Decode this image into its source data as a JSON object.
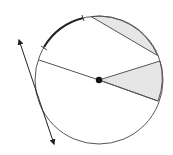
{
  "diagram": {
    "type": "circle-geometry",
    "colors": {
      "stroke": "#555555",
      "arc_highlight": "#222222",
      "fill_shade": "#e6e6e6",
      "center_dot": "#111111",
      "background": "#ffffff"
    },
    "circle": {
      "cx": 99,
      "cy": 80,
      "r": 64
    },
    "elements": [
      {
        "name": "shaded-segment",
        "description": "segment between chord and minor arc (upper right)"
      },
      {
        "name": "shaded-sector",
        "description": "sector between two radii (right)"
      },
      {
        "name": "diameter-line",
        "description": "line through center to circle"
      },
      {
        "name": "tangent-line",
        "description": "double-arrow line tangent to circle on the left"
      },
      {
        "name": "marked-arc",
        "description": "bold arc with tick marks at endpoints (upper left)"
      },
      {
        "name": "center-point",
        "description": "filled dot at circle center"
      }
    ]
  }
}
